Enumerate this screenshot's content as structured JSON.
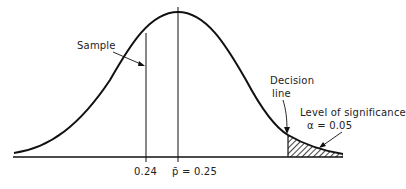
{
  "labels": {
    "sample": "Sample",
    "decision_line_1": "Decision",
    "decision_line_2": "line",
    "level_of_significance": "Level of significance",
    "alpha": "α = 0.05",
    "tick_sample": "0.24",
    "tick_mean": "p̄ = 0.25"
  },
  "diagram": {
    "type": "normal-distribution-curve",
    "mean": 0.25,
    "sample_value": 0.24,
    "alpha": 0.05,
    "rejection_region": "right-tail",
    "colors": {
      "ink": "#111111",
      "background": "#ffffff"
    }
  }
}
